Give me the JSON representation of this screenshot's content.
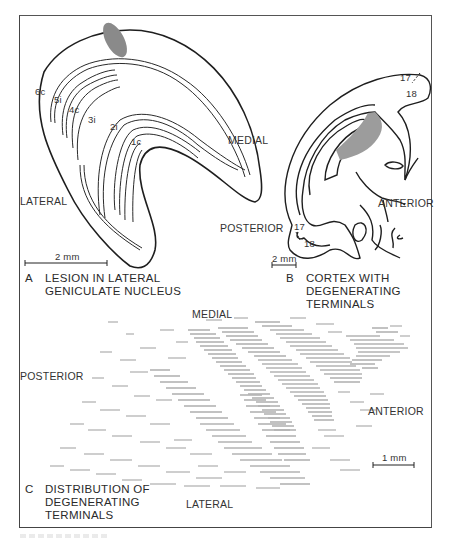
{
  "figure": {
    "panels": [
      {
        "id": "A",
        "letter": "A",
        "caption_line1": "LESION IN LATERAL",
        "caption_line2": "GENICULATE NUCLEUS",
        "scale_bar": "2 mm",
        "orientation": {
          "lateral": "LATERAL",
          "medial": "MEDIAL"
        },
        "layers": [
          "6c",
          "5i",
          "4c",
          "3i",
          "2i",
          "1c"
        ]
      },
      {
        "id": "B",
        "letter": "B",
        "caption_line1": "CORTEX WITH",
        "caption_line2": "DEGENERATING",
        "caption_line3": "TERMINALS",
        "scale_bar": "2 mm",
        "orientation": {
          "posterior": "POSTERIOR",
          "anterior": "ANTERIOR"
        },
        "areas": {
          "top_17": "17",
          "top_18": "18",
          "bottom_17": "17",
          "bottom_18": "18"
        }
      },
      {
        "id": "C",
        "letter": "C",
        "caption_line1": "DISTRIBUTION OF",
        "caption_line2": "DEGENERATING",
        "caption_line3": "TERMINALS",
        "scale_bar": "1 mm",
        "orientation": {
          "medial": "MEDIAL",
          "lateral": "LATERAL",
          "posterior": "POSTERIOR",
          "anterior": "ANTERIOR"
        }
      }
    ],
    "colors": {
      "ink": "#222222",
      "lesion": "#8a8a8a",
      "degeneration": "#b3b3b3",
      "frame": "#555555"
    }
  }
}
